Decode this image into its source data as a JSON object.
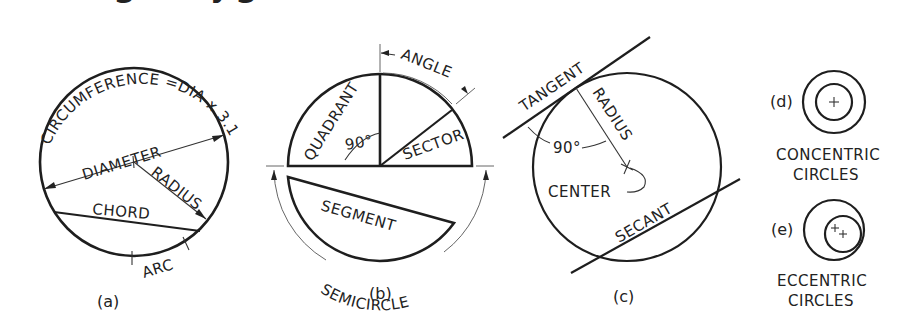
{
  "figure": {
    "header_fragment": "g     yg",
    "panels": [
      {
        "id": "a",
        "caption": "(a)",
        "labels": {
          "circumference": "CIRCUMFERENCE =DIA x 3.1416",
          "diameter": "DIAMETER",
          "radius": "RADIUS",
          "chord": "CHORD",
          "arc": "ARC"
        }
      },
      {
        "id": "b",
        "caption": "(b)",
        "labels": {
          "angle": "ANGLE",
          "quadrant": "QUADRANT",
          "ninety": "90°",
          "sector": "SECTOR",
          "segment": "SEGMENT",
          "semicircle": "SEMICIRCLE"
        }
      },
      {
        "id": "c",
        "caption": "(c)",
        "labels": {
          "tangent": "TANGENT",
          "radius": "RADIUS",
          "ninety": "90°",
          "center": "CENTER",
          "secant": "SECANT"
        }
      },
      {
        "id": "d",
        "caption": "(d)",
        "labels": {
          "line1": "CONCENTRIC",
          "line2": "CIRCLES"
        }
      },
      {
        "id": "e",
        "caption": "(e)",
        "labels": {
          "line1": "ECCENTRIC",
          "line2": "CIRCLES"
        }
      }
    ]
  }
}
